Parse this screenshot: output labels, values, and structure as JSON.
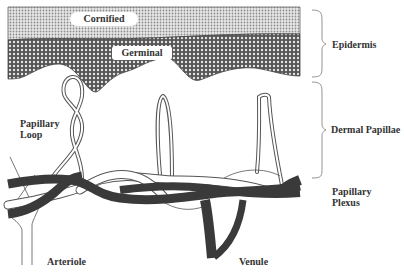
{
  "diagram": {
    "layers": {
      "cornified": "Cornified",
      "germinal": "Germinal"
    },
    "brackets": {
      "epidermis": "Epidermis",
      "dermal_papillae": "Dermal Papillae"
    },
    "labels": {
      "papillary_loop_line1": "Papillary",
      "papillary_loop_line2": "Loop",
      "papillary_plexus_line1": "Papillary",
      "papillary_plexus_line2": "Plexus",
      "arteriole": "Arteriole",
      "venule": "Venule"
    },
    "colors": {
      "vein": "#3a3a3a",
      "artery_fill": "#ffffff",
      "outline": "#555555",
      "cornified_pattern": "#9a9a9a",
      "germinal_pattern": "#555555",
      "bracket": "#888888"
    }
  }
}
